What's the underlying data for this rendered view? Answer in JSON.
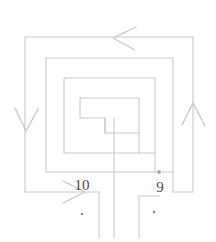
{
  "diagram": {
    "background_color": "#ffffff",
    "line_color": "#c9c9cf",
    "arrow_color": "#c4c4ca",
    "label_color": "#4a4a4a",
    "stroke_width": 1.1,
    "labels": [
      {
        "name": "terminal-label-10",
        "text": "10",
        "x": 82,
        "y": 190
      },
      {
        "name": "terminal-label-9",
        "text": "9",
        "x": 160,
        "y": 192
      }
    ],
    "arrows": [
      {
        "name": "flow-arrow-top",
        "direction": "left",
        "x": 122,
        "y": 37
      },
      {
        "name": "flow-arrow-left",
        "direction": "down",
        "x": 25,
        "y": 120
      },
      {
        "name": "flow-arrow-right",
        "direction": "up",
        "x": 193,
        "y": 115
      },
      {
        "name": "flow-arrow-bottom-left",
        "direction": "right",
        "x": 72,
        "y": 192
      }
    ],
    "junction_dots": [
      {
        "name": "junction-dot-bottom-wire",
        "x": 159,
        "y": 172
      },
      {
        "name": "terminal-dot-left",
        "x": 82,
        "y": 213
      },
      {
        "name": "terminal-dot-right",
        "x": 154,
        "y": 212
      }
    ],
    "spiral_rings": [
      {
        "name": "spiral-ring-1-outer",
        "left": 25,
        "top": 37,
        "right": 193,
        "bottom": 192
      },
      {
        "name": "spiral-ring-2",
        "left": 46,
        "top": 58,
        "right": 173,
        "bottom": 172
      },
      {
        "name": "spiral-ring-3",
        "left": 64,
        "top": 78,
        "right": 155,
        "bottom": 153
      },
      {
        "name": "spiral-ring-4-inner",
        "left": 80,
        "top": 98,
        "right": 139,
        "bottom": 133
      }
    ],
    "center_tap": {
      "name": "center-tap-line",
      "x": 114,
      "y_top": 118,
      "y_bottom": 238
    },
    "terminals": [
      {
        "name": "terminal-bracket-left",
        "path": "M 99 192 L 99 238"
      },
      {
        "name": "terminal-bracket-right",
        "path": "M 139 195 L 139 238"
      }
    ]
  }
}
